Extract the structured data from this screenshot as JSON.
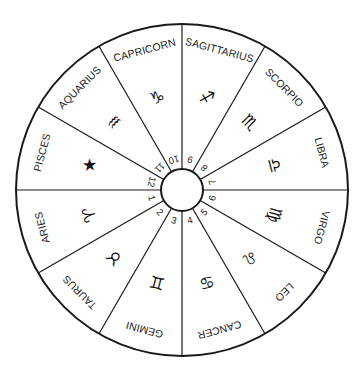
{
  "wheel": {
    "center": [
      182,
      190
    ],
    "outer_radius": 166,
    "inner_radius": 21,
    "stroke_color": "#1a1a1a",
    "background": "#ffffff"
  },
  "sectors": [
    {
      "sign": "SAGITTARIUS",
      "glyph_name": "sagittarius-glyph",
      "glyph": "♐",
      "house": "9"
    },
    {
      "sign": "SCORPIO",
      "glyph_name": "scorpio-glyph",
      "glyph": "♏",
      "house": "8"
    },
    {
      "sign": "LIBRA",
      "glyph_name": "libra-glyph",
      "glyph": "♎",
      "house": "7"
    },
    {
      "sign": "VIRGO",
      "glyph_name": "virgo-glyph",
      "glyph": "♍",
      "house": "6"
    },
    {
      "sign": "LEO",
      "glyph_name": "leo-glyph",
      "glyph": "♌",
      "house": "5"
    },
    {
      "sign": "CANCER",
      "glyph_name": "cancer-glyph",
      "glyph": "♋",
      "house": "4"
    },
    {
      "sign": "GEMINI",
      "glyph_name": "gemini-glyph",
      "glyph": "♊",
      "house": "3"
    },
    {
      "sign": "TAURUS",
      "glyph_name": "taurus-glyph",
      "glyph": "♉",
      "house": "2"
    },
    {
      "sign": "ARIES",
      "glyph_name": "aries-glyph",
      "glyph": "♈",
      "house": "1"
    },
    {
      "sign": "PISCES",
      "glyph_name": "pisces-glyph",
      "glyph": "★",
      "house": "12"
    },
    {
      "sign": "AQUARIUS",
      "glyph_name": "aquarius-glyph",
      "glyph": "♒",
      "house": "11"
    },
    {
      "sign": "CAPRICORN",
      "glyph_name": "capricorn-glyph",
      "glyph": "♑",
      "house": "10"
    }
  ]
}
